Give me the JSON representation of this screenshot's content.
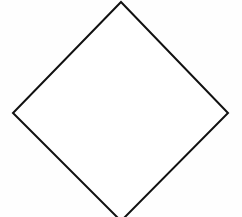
{
  "diagram": {
    "type": "flowchart-shape",
    "shapes": [
      {
        "kind": "diamond",
        "role": "decision",
        "label": "",
        "vertices": {
          "top": [
            121,
            2
          ],
          "right": [
            228,
            113
          ],
          "bottom": [
            121,
            221
          ],
          "left": [
            13,
            113
          ]
        },
        "stroke": "#111111",
        "stroke_width": 2,
        "fill": "#ffffff"
      }
    ]
  },
  "colors": {
    "background": "#fefefe",
    "stroke": "#111111"
  }
}
